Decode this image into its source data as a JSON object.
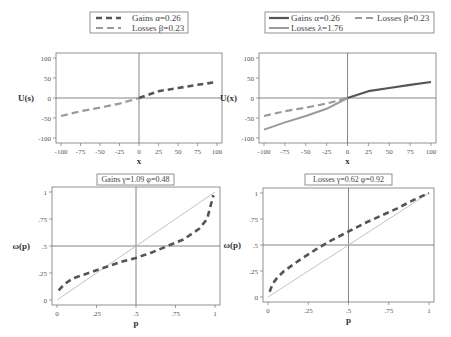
{
  "chart_data": [
    {
      "id": "value-gains-losses",
      "type": "line",
      "title": "",
      "legend": [
        "Gains α=0.26",
        "Losses β=0.23"
      ],
      "legend_position": "top",
      "xlabel": "x",
      "ylabel": "U(s)",
      "xlim": [
        -100,
        100
      ],
      "ylim": [
        -100,
        100
      ],
      "xticks": [
        "-100",
        "-75",
        "-50",
        "-25",
        "0",
        "25",
        "50",
        "75",
        "100"
      ],
      "yticks": [
        "100",
        "50",
        "0",
        "-50",
        "-100"
      ],
      "grid": false,
      "reference_lines": {
        "x": 0,
        "y": 0
      },
      "series": [
        {
          "name": "Gains α=0.26",
          "style": "dashed-dark",
          "color": "#555555",
          "x": [
            0,
            25,
            50,
            75,
            100
          ],
          "values": [
            0,
            17,
            25,
            33,
            40
          ]
        },
        {
          "name": "Losses β=0.23",
          "style": "dashed-light",
          "color": "#9a9a9a",
          "x": [
            -100,
            -75,
            -50,
            -25,
            0
          ],
          "values": [
            -45,
            -33,
            -24,
            -14,
            0
          ]
        }
      ]
    },
    {
      "id": "value-loss-aversion",
      "type": "line",
      "title": "",
      "legend": [
        "Gains α=0.26",
        "Losses β=0.23",
        "Losses λ=1.76"
      ],
      "legend_position": "top",
      "xlabel": "x",
      "ylabel": "U(x)",
      "xlim": [
        -100,
        100
      ],
      "ylim": [
        -100,
        100
      ],
      "xticks": [
        "-100",
        "-75",
        "-50",
        "-25",
        "0",
        "25",
        "50",
        "75",
        "100"
      ],
      "yticks": [
        "100",
        "50",
        "0",
        "-50",
        "-100"
      ],
      "grid": false,
      "reference_lines": {
        "x": 0,
        "y": 0
      },
      "series": [
        {
          "name": "Gains α=0.26",
          "style": "solid-dark",
          "color": "#555555",
          "x": [
            0,
            25,
            50,
            75,
            100
          ],
          "values": [
            0,
            17,
            25,
            33,
            40
          ]
        },
        {
          "name": "Losses β=0.23",
          "style": "dashed-light",
          "color": "#9a9a9a",
          "x": [
            -100,
            -75,
            -50,
            -25,
            0
          ],
          "values": [
            -45,
            -33,
            -24,
            -14,
            0
          ]
        },
        {
          "name": "Losses λ=1.76",
          "style": "solid-light",
          "color": "#9a9a9a",
          "x": [
            -100,
            -75,
            -50,
            -25,
            0
          ],
          "values": [
            -79,
            -61,
            -45,
            -27,
            0
          ]
        }
      ]
    },
    {
      "id": "weighting-gains",
      "type": "line",
      "title": "Gains γ=1.09 φ=0.48",
      "xlabel": "p",
      "ylabel": "ω(p)",
      "xlim": [
        0,
        1
      ],
      "ylim": [
        0,
        1
      ],
      "xticks": [
        "0",
        ".25",
        ".5",
        ".75",
        "1"
      ],
      "yticks": [
        "1",
        ".75",
        ".5",
        ".25",
        "0"
      ],
      "grid": false,
      "reference_lines": {
        "x": 0.5,
        "y": 0.5
      },
      "series": [
        {
          "name": "Identity",
          "style": "solid-thin-light",
          "color": "#bbbbbb",
          "x": [
            0,
            1
          ],
          "values": [
            0,
            1
          ]
        },
        {
          "name": "ω(p)",
          "style": "dashed-dark",
          "color": "#555555",
          "x": [
            0.01,
            0.05,
            0.1,
            0.2,
            0.3,
            0.4,
            0.5,
            0.6,
            0.7,
            0.8,
            0.9,
            0.95,
            0.99
          ],
          "values": [
            0.09,
            0.15,
            0.2,
            0.25,
            0.3,
            0.35,
            0.39,
            0.44,
            0.5,
            0.56,
            0.66,
            0.75,
            0.97
          ]
        }
      ]
    },
    {
      "id": "weighting-losses",
      "type": "line",
      "title": "Losses γ=0.62 φ=0.92",
      "xlabel": "p",
      "ylabel": "ω(p)",
      "xlim": [
        0,
        1
      ],
      "ylim": [
        0,
        1
      ],
      "xticks": [
        "0",
        ".25",
        ".5",
        ".75",
        "1"
      ],
      "yticks": [
        "1",
        ".75",
        ".5",
        ".25",
        "0"
      ],
      "grid": false,
      "reference_lines": {
        "x": 0.5,
        "y": 0.5
      },
      "series": [
        {
          "name": "Identity",
          "style": "solid-thin-light",
          "color": "#bbbbbb",
          "x": [
            0,
            1
          ],
          "values": [
            0,
            1
          ]
        },
        {
          "name": "ω(p)",
          "style": "dashed-dark",
          "color": "#555555",
          "x": [
            0.01,
            0.03,
            0.06,
            0.1,
            0.2,
            0.3,
            0.4,
            0.5,
            0.6,
            0.7,
            0.8,
            0.9,
            1.0
          ],
          "values": [
            0.05,
            0.13,
            0.19,
            0.25,
            0.36,
            0.46,
            0.55,
            0.63,
            0.71,
            0.78,
            0.85,
            0.93,
            1.0
          ]
        }
      ]
    }
  ],
  "layout": {
    "panels": [
      {
        "frame": [
          56,
          53,
          222,
          143
        ],
        "legend_box": [
          90,
          12,
          188,
          33
        ]
      },
      {
        "frame": [
          259,
          53,
          436,
          143
        ],
        "legend_box": [
          265,
          12,
          434,
          33
        ]
      },
      {
        "frame": [
          52,
          187,
          220,
          305
        ],
        "legend_box": [
          97,
          174,
          174,
          185
        ]
      },
      {
        "frame": [
          263,
          188,
          434,
          302
        ],
        "legend_box": [
          305,
          174,
          392,
          185
        ]
      }
    ]
  }
}
